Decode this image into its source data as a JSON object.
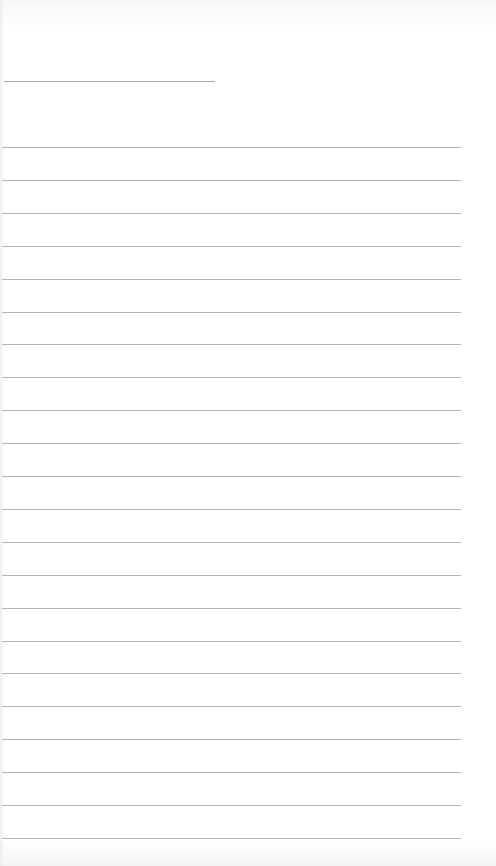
{
  "page": {
    "type": "lined-paper",
    "header_line_label": "",
    "rule_count": 22,
    "rules": [
      "",
      "",
      "",
      "",
      "",
      "",
      "",
      "",
      "",
      "",
      "",
      "",
      "",
      "",
      "",
      "",
      "",
      "",
      "",
      "",
      "",
      ""
    ],
    "colors": {
      "paper": "#ffffff",
      "rule": "#b4b4b4",
      "header_line": "#a9a9a9"
    }
  }
}
